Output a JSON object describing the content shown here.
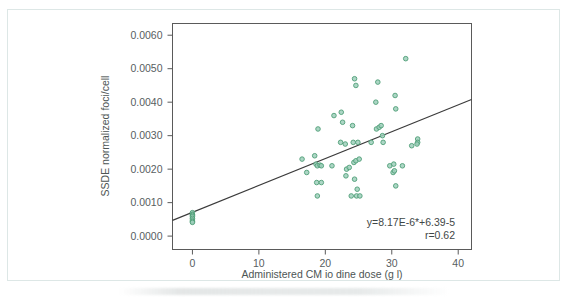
{
  "figure": {
    "background_color": "#ffffff",
    "frame_color": "#dde7e6"
  },
  "chart_data": {
    "type": "scatter",
    "title": "",
    "xlabel": "Administered CM io dine dose (g l)",
    "ylabel": "SSDE normalized foci/cell",
    "xlim": [
      -3,
      42
    ],
    "ylim": [
      -0.0004,
      0.00635
    ],
    "xticks": [
      0,
      10,
      20,
      30,
      40
    ],
    "xticklabels": [
      "0",
      "10",
      "20",
      "30",
      "40"
    ],
    "yticks": [
      0.0,
      0.001,
      0.002,
      0.003,
      0.004,
      0.005,
      0.006
    ],
    "yticklabels": [
      "0.0000",
      "0.0010",
      "0.0020",
      "0.0030",
      "0.0040",
      "0.0050",
      "0.0060"
    ],
    "grid": false,
    "legend": null,
    "marker": {
      "shape": "circle",
      "fill_color": "#9ecfbb",
      "edge_color": "#4f9e77",
      "size_px": 4.6
    },
    "fit_line": {
      "color": "#3b3b3b",
      "width_px": 1.1,
      "slope": 8.17e-06,
      "intercept": 6.39e-05,
      "x_start": -3,
      "x_end": 42,
      "y_start": 0.00047,
      "y_end": 0.004082
    },
    "annotations": [
      {
        "name": "regression-equation",
        "text": "y=8.17E-6*+6.39-5"
      },
      {
        "name": "correlation-coefficient",
        "text": "r=0.62"
      }
    ],
    "points": [
      [
        0.0,
        0.0007
      ],
      [
        0.0,
        0.00065
      ],
      [
        0.0,
        0.00062
      ],
      [
        0.0,
        0.00058
      ],
      [
        0.0,
        0.00053
      ],
      [
        0.0,
        0.00048
      ],
      [
        0.0,
        0.00044
      ],
      [
        0.0,
        0.00041
      ],
      [
        16.5,
        0.0023
      ],
      [
        17.2,
        0.0019
      ],
      [
        18.4,
        0.0024
      ],
      [
        18.6,
        0.00215
      ],
      [
        18.8,
        0.0021
      ],
      [
        19.2,
        0.00212
      ],
      [
        19.4,
        0.0021
      ],
      [
        18.9,
        0.0032
      ],
      [
        18.7,
        0.0016
      ],
      [
        19.4,
        0.0016
      ],
      [
        18.8,
        0.0012
      ],
      [
        21.3,
        0.0036
      ],
      [
        22.4,
        0.0037
      ],
      [
        21.0,
        0.0021
      ],
      [
        22.3,
        0.0028
      ],
      [
        23.0,
        0.00275
      ],
      [
        22.6,
        0.0034
      ],
      [
        23.1,
        0.0018
      ],
      [
        23.2,
        0.002
      ],
      [
        23.6,
        0.00205
      ],
      [
        24.1,
        0.0033
      ],
      [
        24.4,
        0.0047
      ],
      [
        24.6,
        0.0045
      ],
      [
        24.2,
        0.0028
      ],
      [
        24.9,
        0.0028
      ],
      [
        24.3,
        0.0022
      ],
      [
        24.6,
        0.00225
      ],
      [
        25.1,
        0.0023
      ],
      [
        24.4,
        0.0017
      ],
      [
        24.8,
        0.0014
      ],
      [
        23.9,
        0.0012
      ],
      [
        24.7,
        0.0012
      ],
      [
        25.2,
        0.0012
      ],
      [
        26.9,
        0.0028
      ],
      [
        27.6,
        0.004
      ],
      [
        27.7,
        0.0032
      ],
      [
        28.1,
        0.00325
      ],
      [
        28.4,
        0.0033
      ],
      [
        27.9,
        0.0046
      ],
      [
        28.6,
        0.003
      ],
      [
        28.7,
        0.0028
      ],
      [
        29.7,
        0.0021
      ],
      [
        30.3,
        0.00215
      ],
      [
        30.5,
        0.0042
      ],
      [
        30.6,
        0.0038
      ],
      [
        30.2,
        0.0019
      ],
      [
        30.4,
        0.00195
      ],
      [
        30.6,
        0.0015
      ],
      [
        31.6,
        0.0021
      ],
      [
        32.1,
        0.0053
      ],
      [
        33.0,
        0.0027
      ],
      [
        33.9,
        0.0029
      ],
      [
        33.9,
        0.0028
      ],
      [
        33.8,
        0.00275
      ]
    ]
  }
}
